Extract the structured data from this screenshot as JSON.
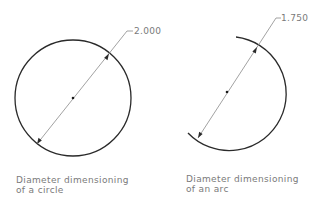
{
  "figures": [
    {
      "id": "circle",
      "dimension_value": "2.000",
      "caption_line1": "Diameter dimensioning",
      "caption_line2": "of a circle"
    },
    {
      "id": "arc",
      "dimension_value": "1.750",
      "caption_line1": "Diameter dimensioning",
      "caption_line2": "of an arc"
    }
  ],
  "colors": {
    "outline": "#2a2a2a",
    "dimension_line": "#8a8a8a",
    "text": "#7a7a7a"
  }
}
